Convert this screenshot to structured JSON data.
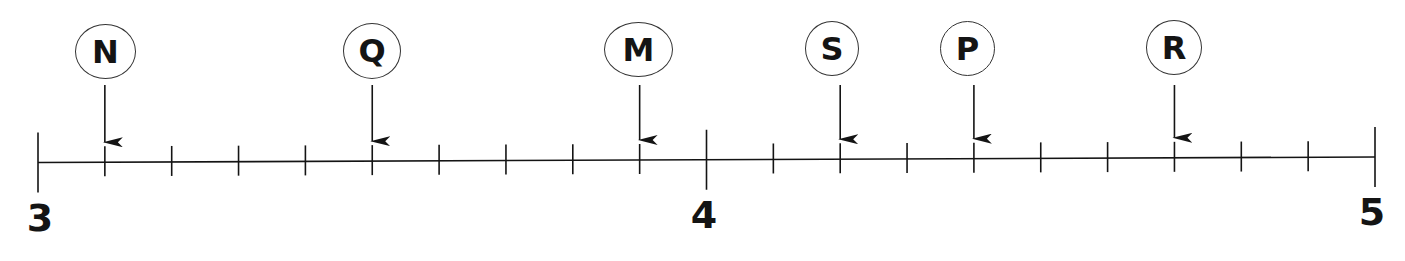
{
  "chart_data": {
    "type": "number-line",
    "title": "",
    "range": [
      3,
      5
    ],
    "major_ticks": [
      3,
      4,
      5
    ],
    "minor_step": 0.1,
    "tick_labels": [
      "3",
      "4",
      "5"
    ],
    "points": [
      {
        "label": "N",
        "value": 3.1
      },
      {
        "label": "Q",
        "value": 3.5
      },
      {
        "label": "M",
        "value": 3.9
      },
      {
        "label": "S",
        "value": 4.2
      },
      {
        "label": "P",
        "value": 4.4
      },
      {
        "label": "R",
        "value": 4.7
      }
    ]
  },
  "axis": {
    "label_3": "3",
    "label_4": "4",
    "label_5": "5"
  },
  "markers": {
    "n": "N",
    "q": "Q",
    "m": "M",
    "s": "S",
    "p": "P",
    "r": "R"
  },
  "colors": {
    "ink": "#141414",
    "background": "#ffffff"
  }
}
